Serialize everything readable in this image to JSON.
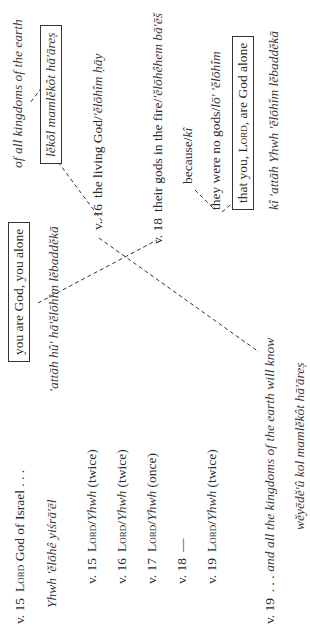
{
  "orientation": "rotated-90-ccw",
  "left_column": {
    "header": {
      "verse": "v. 15",
      "lord": "Lord",
      "text": "God of Israel . . ."
    },
    "header_translit": "Yhwh 'ĕlōhê yiśrā'ēl",
    "verse_items": [
      {
        "verse": "v. 15",
        "lord": "Lord",
        "slash": "/",
        "yhwh": "Yhwh",
        "count": "(twice)"
      },
      {
        "verse": "v. 16",
        "lord": "Lord",
        "slash": "/",
        "yhwh": "Yhwh",
        "count": "(twice)"
      },
      {
        "verse": "v. 17",
        "lord": "Lord",
        "slash": "/",
        "yhwh": "Yhwh",
        "count": "(once)"
      },
      {
        "verse": "v. 18",
        "dash": "—"
      },
      {
        "verse": "v. 19",
        "lord": "Lord",
        "slash": "/",
        "yhwh": "Yhwh",
        "count": "(twice)"
      }
    ],
    "footer": {
      "verse": "v. 19",
      "text": ". . . and all the kingdoms of the earth will know"
    },
    "footer_translit": "wĕyēdĕ'û kol mamlĕkôt hā'āreṣ"
  },
  "middle_column": {
    "boxed_phrase": "you are God, you alone",
    "translit": "'attāh hû' hā'ĕlōhîm lĕbaddĕkā"
  },
  "right_column": {
    "top_phrase": "of all kingdoms of the earth",
    "top_boxed_translit": "lĕkōl mamlĕkôt hā'āreṣ",
    "v16": {
      "verse": "v. 16",
      "text": "the living God/",
      "translit": "'ĕlōhîm ḥāy"
    },
    "v18": {
      "verse": "v. 18",
      "text": "their gods in the fire/",
      "translit": "'ĕlōhêhem bā'ēš"
    },
    "because": {
      "text": "because/",
      "translit": "kî"
    },
    "no_gods": {
      "text": "they were no gods/",
      "translit": "lō' 'ĕlōhîm"
    },
    "boxed_conclusion": {
      "pre": "that you, ",
      "lord": "Lord",
      "post": ", are God alone"
    },
    "conclusion_translit": "kî 'attāh Yhwh 'ĕlōhîm lĕbaddĕkā"
  },
  "connectors": [
    {
      "from": "lĕkōl mamlĕkôt hā'āreṣ",
      "to": "of all kingdoms of the earth"
    },
    {
      "from": "lĕkōl mamlĕkôt hā'āreṣ",
      "to": "v. 16 the living God"
    },
    {
      "from": "you are God, you alone",
      "to": "v. 18 their gods in the fire"
    },
    {
      "from": "v. 16 the living God",
      "to": "and all the kingdoms of the earth will know"
    },
    {
      "from": "because/kî",
      "to": "they were no gods"
    },
    {
      "from": "they were no gods",
      "to": "that you, Lord, are God alone"
    }
  ]
}
